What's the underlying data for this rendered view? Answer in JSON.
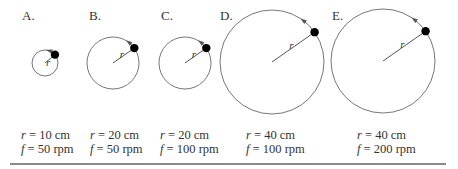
{
  "panels": [
    {
      "label": "A.",
      "radius_var": "r",
      "r_text": "= 10 cm",
      "f_text": "= 50 rpm",
      "circle": {
        "cx": 45,
        "cy": 63,
        "r": 13
      },
      "ball_angle": -40
    },
    {
      "label": "B.",
      "radius_var": "r",
      "r_text": "= 20 cm",
      "f_text": "= 50 rpm",
      "circle": {
        "cx": 113,
        "cy": 63,
        "r": 26
      },
      "ball_angle": -35
    },
    {
      "label": "C.",
      "radius_var": "r",
      "r_text": "= 20 cm",
      "f_text": "= 100 rpm",
      "circle": {
        "cx": 185,
        "cy": 63,
        "r": 26
      },
      "ball_angle": -35
    },
    {
      "label": "D.",
      "radius_var": "r",
      "r_text": "= 40 cm",
      "f_text": "= 100 rpm",
      "circle": {
        "cx": 272,
        "cy": 62,
        "r": 52
      },
      "ball_angle": -35
    },
    {
      "label": "E.",
      "radius_var": "r",
      "r_text": "= 40 cm",
      "f_text": "= 200 rpm",
      "circle": {
        "cx": 383,
        "cy": 61,
        "r": 52
      },
      "ball_angle": -35
    }
  ],
  "symbols": {
    "r": "r",
    "f": "f"
  },
  "colors": {
    "circle": "#777777",
    "ball": "#000000",
    "radius": "#555555",
    "rule": "#8a8a8a"
  }
}
